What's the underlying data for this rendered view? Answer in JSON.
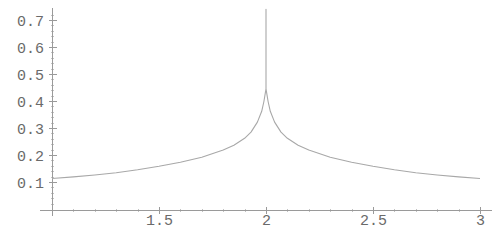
{
  "chart_data": {
    "type": "line",
    "title": "",
    "xlabel": "",
    "ylabel": "",
    "xlim": [
      1,
      3
    ],
    "ylim": [
      0,
      0.74
    ],
    "grid": false,
    "legend": null,
    "x_ticks": [
      {
        "value": 1.5,
        "label": "1.5"
      },
      {
        "value": 2,
        "label": "2"
      },
      {
        "value": 2.5,
        "label": "2.5"
      },
      {
        "value": 3,
        "label": "3"
      }
    ],
    "y_ticks": [
      {
        "value": 0.1,
        "label": "0.1"
      },
      {
        "value": 0.2,
        "label": "0.2"
      },
      {
        "value": 0.3,
        "label": "0.3"
      },
      {
        "value": 0.4,
        "label": "0.4"
      },
      {
        "value": 0.5,
        "label": "0.5"
      },
      {
        "value": 0.6,
        "label": "0.6"
      },
      {
        "value": 0.7,
        "label": "0.7"
      }
    ],
    "series": [
      {
        "name": "f(x)",
        "color": "#a8a8a8",
        "x": [
          1.0,
          1.1,
          1.2,
          1.3,
          1.4,
          1.5,
          1.6,
          1.7,
          1.8,
          1.85,
          1.9,
          1.93,
          1.96,
          1.98,
          1.99,
          2.0,
          2.0,
          2.0,
          2.01,
          2.02,
          2.04,
          2.07,
          2.1,
          2.15,
          2.2,
          2.3,
          2.4,
          2.5,
          2.6,
          2.7,
          2.8,
          2.9,
          3.0
        ],
        "y": [
          0.113,
          0.119,
          0.126,
          0.134,
          0.145,
          0.158,
          0.173,
          0.192,
          0.218,
          0.236,
          0.262,
          0.285,
          0.322,
          0.362,
          0.398,
          0.445,
          0.74,
          0.445,
          0.398,
          0.362,
          0.322,
          0.285,
          0.262,
          0.236,
          0.218,
          0.192,
          0.173,
          0.158,
          0.145,
          0.134,
          0.126,
          0.119,
          0.113
        ]
      }
    ]
  },
  "style": {
    "axis_color": "#9a9a9a",
    "curve_color": "#a8a8a8",
    "text_color": "#6a6a6a"
  }
}
